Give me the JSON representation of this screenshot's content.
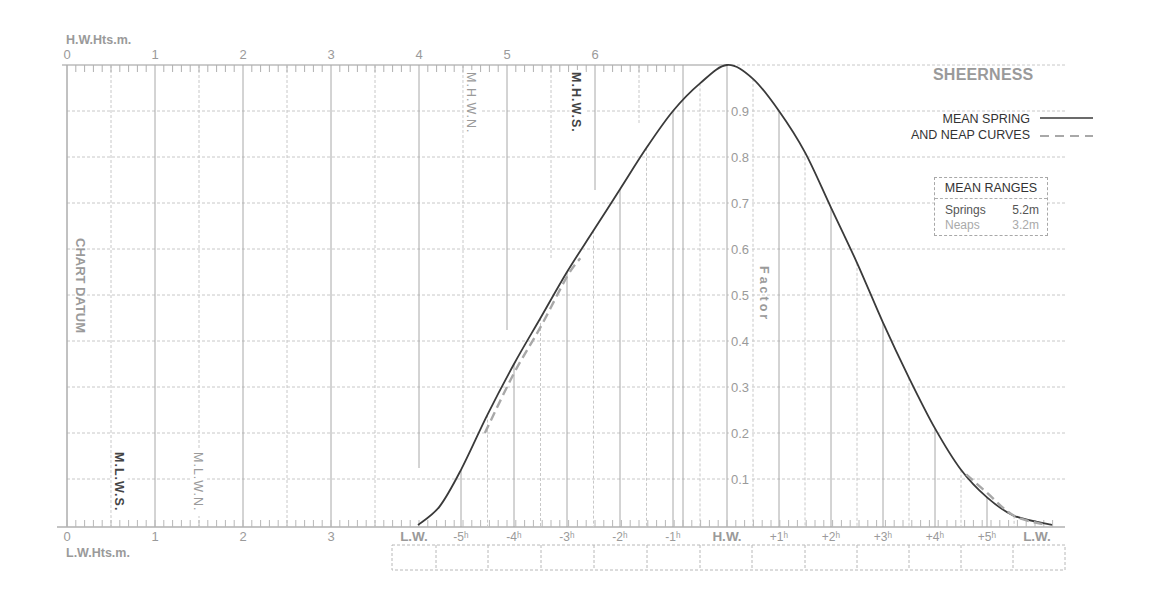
{
  "chart_data": {
    "type": "line",
    "title": "SHEERNESS",
    "top_axis": {
      "label": "H.W.Hts.m.",
      "ticks": [
        "0",
        "1",
        "2",
        "3",
        "4",
        "5",
        "6"
      ]
    },
    "bottom_axis": {
      "label": "L.W.Hts.m.",
      "ticks": [
        "0",
        "1",
        "2",
        "3"
      ]
    },
    "left_label": "CHART DATUM",
    "factor_axis": {
      "label": "Factor",
      "ticks": [
        "0.1",
        "0.2",
        "0.3",
        "0.4",
        "0.5",
        "0.6",
        "0.7",
        "0.8",
        "0.9"
      ],
      "ylim": [
        0,
        1.0
      ]
    },
    "time_axis": {
      "ticks": [
        "L.W.",
        "-5ʰ",
        "-4ʰ",
        "-3ʰ",
        "-2ʰ",
        "-1ʰ",
        "H.W.",
        "+1ʰ",
        "+2ʰ",
        "+3ʰ",
        "+4ʰ",
        "+5ʰ",
        "L.W."
      ]
    },
    "height_markers": [
      {
        "label": "M.H.W.N.",
        "value_m": 4.6,
        "style": "light"
      },
      {
        "label": "M.H.W.S.",
        "value_m": 5.8,
        "style": "bold"
      },
      {
        "label": "M.L.W.S.",
        "value_m": 0.6,
        "style": "bold"
      },
      {
        "label": "M.L.W.N.",
        "value_m": 1.5,
        "style": "light"
      }
    ],
    "x": [
      -6,
      -5.5,
      -5,
      -4.5,
      -4,
      -3.5,
      -3,
      -2.5,
      -2,
      -1.5,
      -1,
      -0.5,
      0,
      0.5,
      1,
      1.5,
      2,
      2.5,
      3,
      3.5,
      4,
      4.5,
      5,
      5.5,
      6.2
    ],
    "series": [
      {
        "name": "Mean Spring",
        "style": "solid",
        "values": [
          0.0,
          0.04,
          0.12,
          0.24,
          0.35,
          0.45,
          0.55,
          0.64,
          0.73,
          0.82,
          0.9,
          0.96,
          1.0,
          0.97,
          0.9,
          0.81,
          0.69,
          0.57,
          0.44,
          0.32,
          0.21,
          0.12,
          0.06,
          0.02,
          0.0
        ]
      },
      {
        "name": "Mean Neap",
        "style": "dashed",
        "x": [
          -4.55,
          -4.0,
          -3.5,
          -3.0,
          -2.75,
          4.6,
          5.0,
          5.5,
          6.1
        ],
        "values": [
          0.2,
          0.33,
          0.43,
          0.54,
          0.58,
          0.11,
          0.07,
          0.02,
          0.0
        ]
      }
    ],
    "legend": {
      "line1": "MEAN SPRING",
      "line2": "AND NEAP CURVES"
    },
    "mean_ranges": {
      "header": "MEAN RANGES",
      "springs_label": "Springs",
      "springs_value": "5.2m",
      "neaps_label": "Neaps",
      "neaps_value": "3.2m"
    }
  },
  "colors": {
    "curve": "#3a3a3a",
    "neap": "#a8a8a8",
    "grid_solid": "#b8b8b8",
    "grid_dashed": "#c8c8c8",
    "label": "#9a9a9a",
    "dark_label": "#444444"
  }
}
